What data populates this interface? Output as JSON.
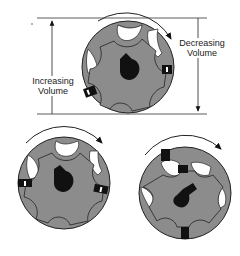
{
  "diagram": {
    "labels": {
      "increasing_line1": "Increasing",
      "increasing_line2": "Volume",
      "decreasing_line1": "Decreasing",
      "decreasing_line2": "Volume"
    },
    "gears": [
      {
        "name": "top",
        "rotation": "clockwise"
      },
      {
        "name": "bottom-left",
        "rotation": "clockwise"
      },
      {
        "name": "bottom-right",
        "rotation": "clockwise"
      }
    ],
    "colors": {
      "housing": "#8c8c8c",
      "chamber": "#ffffff",
      "seal": "#111111",
      "shaft": "#111111",
      "outline": "#222222"
    }
  }
}
